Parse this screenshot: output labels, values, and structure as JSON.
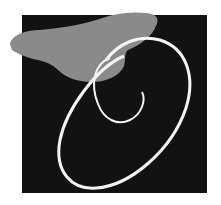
{
  "figure": {
    "letter": "O",
    "colors": {
      "background": "#ffffff",
      "square": "#121212",
      "butterfly": "#8a8a8a",
      "letter": "#f4f4f4"
    }
  }
}
